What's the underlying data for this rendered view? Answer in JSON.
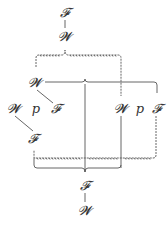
{
  "diagram": {
    "nodes": {
      "top_F": {
        "label": "𝓕",
        "x": 65,
        "y": 16
      },
      "top_W": {
        "label": "𝓦",
        "x": 65,
        "y": 40
      },
      "mid_W": {
        "label": "𝓦",
        "x": 35,
        "y": 86
      },
      "row_left_W": {
        "label": "𝓦",
        "x": 14,
        "y": 112
      },
      "row_left_p": {
        "label": "p",
        "x": 36,
        "y": 112
      },
      "row_left_F": {
        "label": "𝓕",
        "x": 56,
        "y": 112
      },
      "row_right_W": {
        "label": "𝓦",
        "x": 121,
        "y": 112
      },
      "row_right_p": {
        "label": "p",
        "x": 140,
        "y": 112
      },
      "row_right_F": {
        "label": "𝓕",
        "x": 157,
        "y": 112
      },
      "low_F": {
        "label": "𝓕",
        "x": 33,
        "y": 142
      },
      "bottom_F": {
        "label": "𝓕",
        "x": 85,
        "y": 189
      },
      "bottom_W": {
        "label": "𝓦",
        "x": 85,
        "y": 214
      }
    },
    "line_color": "#555555",
    "text_color": "#333333"
  }
}
